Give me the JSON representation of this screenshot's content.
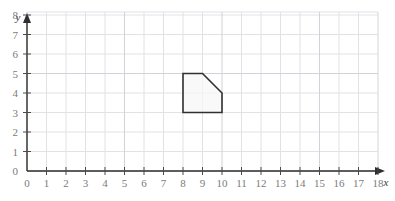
{
  "figure": {
    "kind": "coordinate-grid-plot",
    "background_color": "#ffffff",
    "grid_minor_color": "#e2e2e6",
    "grid_major_color": "#d2d2d8",
    "axis_color": "#2f2f2f",
    "label_color": "#7b7b7b"
  },
  "axes": {
    "x": {
      "name": "x",
      "ticks": [
        "0",
        "1",
        "2",
        "3",
        "4",
        "5",
        "6",
        "7",
        "8",
        "9",
        "10",
        "11",
        "12",
        "13",
        "14",
        "15",
        "16",
        "17",
        "18"
      ],
      "min": 0,
      "max": 18,
      "has_arrow": true
    },
    "y": {
      "name": "y",
      "ticks": [
        "0",
        "1",
        "2",
        "3",
        "4",
        "5",
        "6",
        "7",
        "8"
      ],
      "min": 0,
      "max": 8,
      "has_arrow": true
    }
  },
  "chart_data": {
    "type": "scatter",
    "title": "",
    "xlabel": "x",
    "ylabel": "y",
    "xlim": [
      0,
      18
    ],
    "ylim": [
      0,
      8
    ],
    "grid": true,
    "legend": "none",
    "shapes": [
      {
        "name": "pentagon-figure",
        "closed": true,
        "fill": "#f7f7f7",
        "stroke": "#303030",
        "vertices": [
          [
            8,
            3
          ],
          [
            8,
            5
          ],
          [
            9,
            5
          ],
          [
            10,
            4
          ],
          [
            10,
            3
          ]
        ]
      }
    ]
  },
  "top_fragment": {
    "text": ""
  }
}
